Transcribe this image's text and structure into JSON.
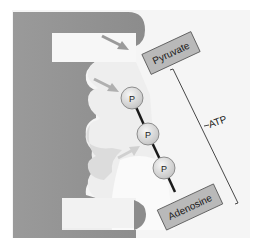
{
  "diagram": {
    "type": "enzyme-substrate binding illustration",
    "substrates": {
      "pyruvate": {
        "label": "Pyruvate"
      },
      "atp": {
        "bracket_label": "ATP",
        "phosphates": [
          {
            "label": "P"
          },
          {
            "label": "P"
          },
          {
            "label": "P"
          }
        ],
        "base": {
          "label": "Adenosine"
        }
      }
    },
    "colors": {
      "background": "#f4f4f4",
      "enzyme_dark": "#8a8a8a",
      "enzyme_mid": "#a8a8a8",
      "pocket_light": "#ececec",
      "pocket_lighter": "#f7f7f7",
      "box_fill": "#b9b9b9",
      "box_stroke": "#555555",
      "phosphate_fill": "#d9d9d9",
      "arrow": "#9a9a9a",
      "bond": "#1a1a1a"
    }
  }
}
